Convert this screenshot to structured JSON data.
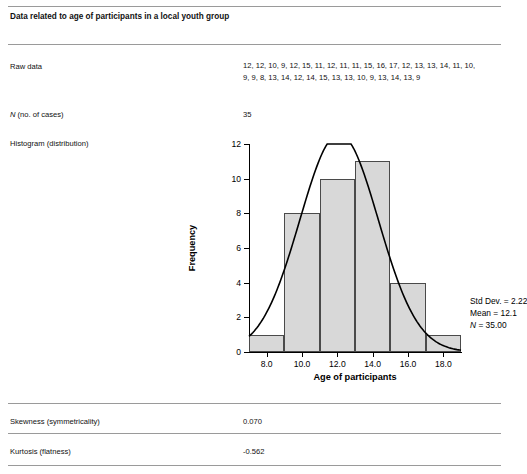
{
  "title": "Data related to age of participants in a local youth group",
  "rows": {
    "raw_data_label": "Raw data",
    "raw_data_value": "12, 12, 10, 9, 12, 15, 11, 12, 11, 11, 15, 16, 17, 12, 13, 13, 14, 11, 10, 9, 9, 8, 13, 14, 12, 14, 15, 13, 13, 10, 9, 13, 14, 13, 9",
    "n_cases_label_prefix": "N",
    "n_cases_label_rest": " (no. of cases)",
    "n_cases_value": "35",
    "histogram_label": "Histogram (distribution)",
    "skewness_label": "Skewness (symmetricality)",
    "skewness_value": "0.070",
    "kurtosis_label": "Kurtosis (flatness)",
    "kurtosis_value": "-0.562"
  },
  "chart_data": {
    "type": "bar",
    "title": "",
    "xlabel": "Age of participants",
    "ylabel": "Frequency",
    "categories": [
      "8.0",
      "10.0",
      "12.0",
      "14.0",
      "16.0",
      "18.0"
    ],
    "bins": [
      {
        "left": 7.0,
        "right": 9.0,
        "value": 1
      },
      {
        "left": 9.0,
        "right": 11.0,
        "value": 8
      },
      {
        "left": 11.0,
        "right": 13.0,
        "value": 10
      },
      {
        "left": 13.0,
        "right": 15.0,
        "value": 11
      },
      {
        "left": 15.0,
        "right": 17.0,
        "value": 4
      },
      {
        "left": 17.0,
        "right": 19.0,
        "value": 1
      }
    ],
    "values": [
      1,
      8,
      10,
      11,
      4,
      1
    ],
    "xlim": [
      7.0,
      19.0
    ],
    "ylim": [
      0,
      12
    ],
    "xticks": [
      "8.0",
      "10.0",
      "12.0",
      "14.0",
      "16.0",
      "18.0"
    ],
    "xtick_values": [
      8.0,
      10.0,
      12.0,
      14.0,
      16.0,
      18.0
    ],
    "yticks": [
      "0",
      "2",
      "4",
      "6",
      "8",
      "10",
      "12"
    ],
    "ytick_values": [
      0,
      2,
      4,
      6,
      8,
      10,
      12
    ],
    "grid": false,
    "legend": "none",
    "overlay": {
      "type": "normal-curve",
      "mean": 12.1,
      "std_dev": 2.22,
      "n": 35
    },
    "annotations": {
      "std_dev": "Std Dev. = 2.22",
      "mean": "Mean = 12.1",
      "n_prefix": "N",
      "n_rest": " = 35.00"
    },
    "bar_fill": "#d8d8d8",
    "bar_stroke": "#4a4a4a"
  }
}
